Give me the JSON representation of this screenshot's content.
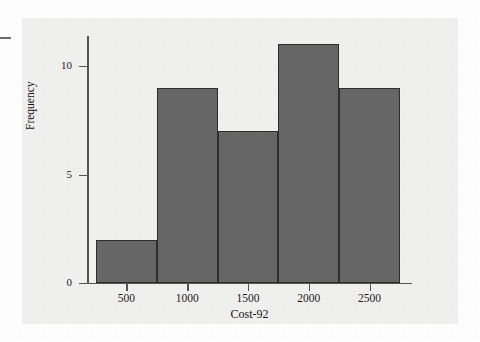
{
  "chart_data": {
    "type": "bar",
    "title": "",
    "subtitle": "",
    "xlabel": "Cost-92",
    "ylabel": "Frequency",
    "grid": false,
    "legend": null,
    "bin_width": 500,
    "bin_edges": [
      250,
      750,
      1250,
      1750,
      2250,
      2750
    ],
    "categories": [
      "250-750",
      "750-1250",
      "1250-1750",
      "1750-2250",
      "2250-2750"
    ],
    "values": [
      2,
      9,
      7,
      11,
      9
    ],
    "x_ticks": [
      500,
      1000,
      1500,
      2000,
      2500
    ],
    "x_tick_labels": [
      "500",
      "1000",
      "1500",
      "2000",
      "2500"
    ],
    "y_ticks": [
      0,
      5,
      10
    ],
    "y_tick_labels": [
      "0",
      "5",
      "10"
    ],
    "xlim": [
      250,
      2750
    ],
    "ylim": [
      0,
      11.45
    ],
    "bar_fill_color": "#666666",
    "bar_edge_color": "#2e2e2e",
    "axis_color": "#555555",
    "panel_color": "#f0f0ee"
  }
}
